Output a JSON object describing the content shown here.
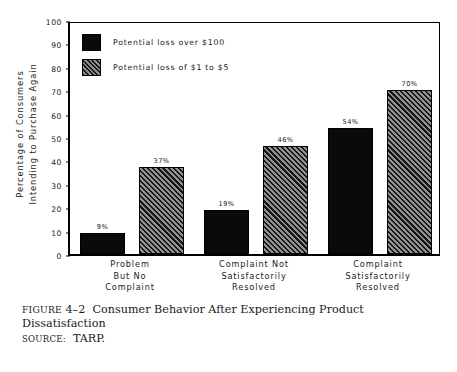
{
  "chart_data": {
    "type": "bar",
    "title": "",
    "xlabel": "",
    "ylabel": "Percentage of Consumers Intending to Purchase Again",
    "ylabel_lines": [
      "Percentage of Consumers",
      "Intending to Purchase Again"
    ],
    "ylim": [
      0,
      100
    ],
    "yticks": [
      0,
      10,
      20,
      30,
      40,
      50,
      60,
      70,
      80,
      90,
      100
    ],
    "ytick_labels": [
      "0",
      "10",
      "20",
      "30",
      "40",
      "50",
      "60",
      "70",
      "80",
      "90",
      "100"
    ],
    "grid": false,
    "legend_position": "top-left",
    "categories": [
      "Problem But No Complaint",
      "Complaint Not Satisfactorily Resolved",
      "Complaint Satisfactorily Resolved"
    ],
    "category_lines": [
      [
        "Problem",
        "But No",
        "Complaint"
      ],
      [
        "Complaint Not",
        "Satisfactorily",
        "Resolved"
      ],
      [
        "Complaint",
        "Satisfactorily",
        "Resolved"
      ]
    ],
    "series": [
      {
        "name": "Potential loss over $100",
        "fill": "solid",
        "color": "#0a0a0a",
        "values": [
          9,
          19,
          54
        ],
        "value_labels": [
          "9%",
          "19%",
          "54%"
        ]
      },
      {
        "name": "Potential loss of $1 to $5",
        "fill": "hatch",
        "color": "#6e6e6e",
        "values": [
          37,
          46,
          70
        ],
        "value_labels": [
          "37%",
          "46%",
          "70%"
        ]
      }
    ]
  },
  "legend": {
    "items": [
      {
        "label": "Potential loss over $100",
        "swatch": "solid-swatch"
      },
      {
        "label": "Potential loss of $1 to $5",
        "swatch": "hatched-swatch"
      }
    ]
  },
  "caption": {
    "figure_label": "FIGURE",
    "figure_number": "4–2",
    "title": "Consumer Behavior After Experiencing Product Dissatisfaction",
    "source_label": "SOURCE:",
    "source_value": "TARP."
  }
}
